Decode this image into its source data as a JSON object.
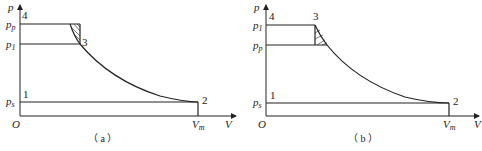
{
  "figure": {
    "panels": [
      {
        "id": "a",
        "caption": "（ a ）",
        "y_axis_label": "p",
        "x_axis_label": "V",
        "origin_label": "O",
        "y_ticks": [
          {
            "main": "p",
            "sub": "p",
            "level": "upper"
          },
          {
            "main": "p",
            "sub": "1",
            "level": "middle"
          },
          {
            "main": "p",
            "sub": "s",
            "level": "lower"
          }
        ],
        "x_ticks": [
          {
            "main": "V",
            "sub": "m"
          }
        ],
        "points": [
          "1",
          "2",
          "3",
          "4"
        ],
        "description": "Upper horizontal line at p_p (point 4), lower line at p_1 to point 3; curve from p_p level down through 3 to point 2 at V_m; hatched triangle between p_p and p_1"
      },
      {
        "id": "b",
        "caption": "（ b ）",
        "y_axis_label": "p",
        "x_axis_label": "V",
        "origin_label": "O",
        "y_ticks": [
          {
            "main": "p",
            "sub": "1",
            "level": "upper"
          },
          {
            "main": "p",
            "sub": "p",
            "level": "middle"
          },
          {
            "main": "p",
            "sub": "s",
            "level": "lower"
          }
        ],
        "x_ticks": [
          {
            "main": "V",
            "sub": "m"
          }
        ],
        "points": [
          "1",
          "2",
          "3",
          "4"
        ],
        "description": "Upper horizontal line at p_1 from 4 to 3, lower line at p_p; curve from 3 down to point 2 at V_m; hatched triangle between p_1 and p_p"
      }
    ]
  },
  "labels": {
    "a": {
      "p": "p",
      "V": "V",
      "O": "O",
      "pp_main": "p",
      "pp_sub": "p",
      "p1_main": "p",
      "p1_sub": "1",
      "ps_main": "p",
      "ps_sub": "s",
      "vm_main": "V",
      "vm_sub": "m",
      "pt1": "1",
      "pt2": "2",
      "pt3": "3",
      "pt4": "4",
      "caption": "（ a ）"
    },
    "b": {
      "p": "p",
      "V": "V",
      "O": "O",
      "p1_main": "p",
      "p1_sub": "1",
      "pp_main": "p",
      "pp_sub": "p",
      "ps_main": "p",
      "ps_sub": "s",
      "vm_main": "V",
      "vm_sub": "m",
      "pt1": "1",
      "pt2": "2",
      "pt3": "3",
      "pt4": "4",
      "caption": "（ b ）"
    }
  }
}
